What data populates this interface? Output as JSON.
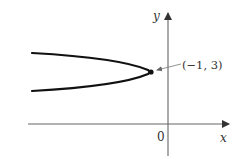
{
  "figure": {
    "type": "parabola graph",
    "axes": {
      "x_label": "x",
      "y_label": "y",
      "origin_label": "0"
    },
    "vertex": {
      "label": "(−1, 3)",
      "x": -1,
      "y": 3
    },
    "colors": {
      "curve": "#111111",
      "axes": "#555555",
      "text": "#333333",
      "background": "#ffffff"
    }
  }
}
